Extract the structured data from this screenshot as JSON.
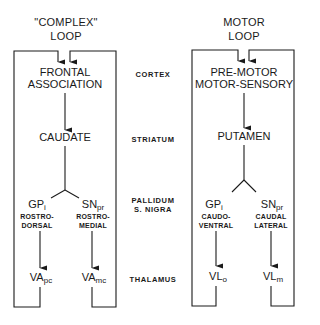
{
  "left_loop": {
    "title_line1": "\"COMPLEX\"",
    "title_line2": "LOOP",
    "cortex_line1": "FRONTAL",
    "cortex_line2": "ASSOCIATION",
    "striatum": "CAUDATE",
    "pallidum": {
      "main": "GP",
      "sub": "i",
      "desc_line1": "ROSTRO-",
      "desc_line2": "DORSAL"
    },
    "nigra": {
      "main": "SN",
      "sub": "pr",
      "desc_line1": "ROSTRO-",
      "desc_line2": "MEDIAL"
    },
    "thalamus_a": {
      "main": "VA",
      "sub": "pc"
    },
    "thalamus_b": {
      "main": "VA",
      "sub": "mc"
    }
  },
  "right_loop": {
    "title_line1": "MOTOR",
    "title_line2": "LOOP",
    "cortex_line1": "PRE-MOTOR",
    "cortex_line2": "MOTOR-SENSORY",
    "striatum": "PUTAMEN",
    "pallidum": {
      "main": "GP",
      "sub": "i",
      "desc_line1": "CAUDO-",
      "desc_line2": "VENTRAL"
    },
    "nigra": {
      "main": "SN",
      "sub": "pr",
      "desc_line1": "CAUDAL",
      "desc_line2": "LATERAL"
    },
    "thalamus_a": {
      "main": "VL",
      "sub": "o"
    },
    "thalamus_b": {
      "main": "VL",
      "sub": "m"
    }
  },
  "levels": {
    "cortex": "CORTEX",
    "striatum": "STRIATUM",
    "pallidum_line1": "PALLIDUM",
    "pallidum_line2": "S. NIGRA",
    "thalamus": "THALAMUS"
  },
  "colors": {
    "ink": "#1a1a1a",
    "background": "#ffffff"
  }
}
